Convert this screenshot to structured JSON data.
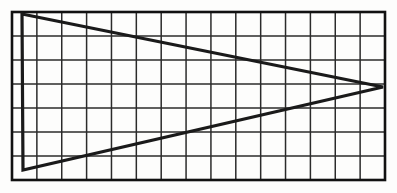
{
  "figure": {
    "background_color": "#fdfdfc",
    "ink_color": "#1a1a1a",
    "grid_line_color": "#2b2b2b",
    "border_color": "#111111",
    "grid": {
      "columns": 15,
      "rows": 7,
      "cell_width": 24.9,
      "cell_height": 24,
      "left": 12,
      "top": 12,
      "right": 385,
      "bottom": 180,
      "border_width": 2.6,
      "line_width": 1.5
    },
    "shape": {
      "name": "triangle",
      "stroke_width": 3.2,
      "fill": "none",
      "vertices": [
        {
          "label": "top-left",
          "x": 22,
          "y": 14
        },
        {
          "label": "apex-right",
          "x": 383,
          "y": 87
        },
        {
          "label": "bottom-left",
          "x": 23,
          "y": 170
        }
      ]
    }
  }
}
